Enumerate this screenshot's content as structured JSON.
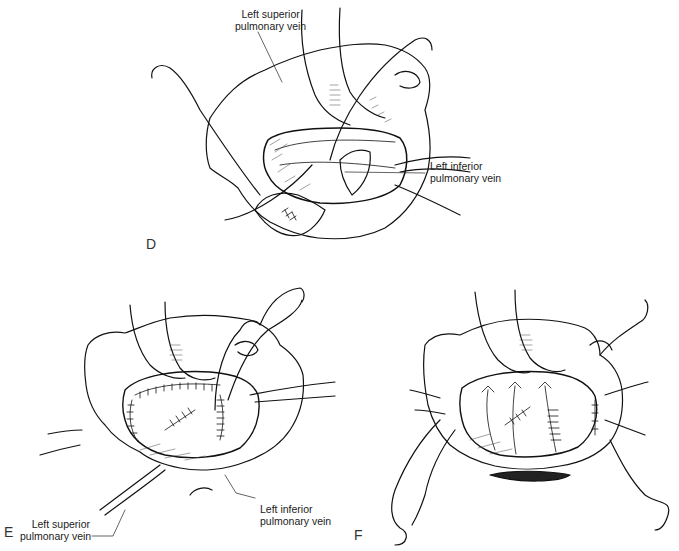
{
  "figure": {
    "panels": [
      {
        "id": "D",
        "letter": "D",
        "labels": {
          "superior": [
            "Left superior",
            "pulmonary vein"
          ],
          "inferior": [
            "Left inferior",
            "pulmonary vein"
          ]
        }
      },
      {
        "id": "E",
        "letter": "E",
        "labels": {
          "superior": [
            "Left superior",
            "pulmonary vein"
          ],
          "inferior": [
            "Left inferior",
            "pulmonary vein"
          ]
        }
      },
      {
        "id": "F",
        "letter": "F"
      }
    ],
    "caption_cutoff": ""
  }
}
